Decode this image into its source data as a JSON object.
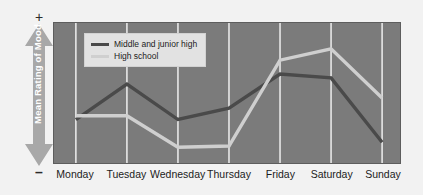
{
  "axis": {
    "y_title": "Mean Rating of Mood",
    "positive_marker": "+",
    "negative_marker": "–"
  },
  "legend": {
    "items": [
      {
        "label": "Middle and junior high",
        "color": "#4a4a4a"
      },
      {
        "label": "High school",
        "color": "#cfcfcf"
      }
    ]
  },
  "colors": {
    "plot_background": "#7b7b7b",
    "figure_background": "#f2f2f2",
    "gridline": "#e8e8e8",
    "middle_junior_high": "#4a4a4a",
    "high_school": "#cfcfcf",
    "axis_arrow": "#a8a8a8",
    "text": "#1c1c1c"
  },
  "xlabels": [
    "Monday",
    "Tuesday",
    "Wednesday",
    "Thursday",
    "Friday",
    "Saturday",
    "Sunday"
  ],
  "chart_data": {
    "type": "line",
    "title": "",
    "xlabel": "",
    "ylabel": "Mean Rating of Mood",
    "ylim": [
      0,
      100
    ],
    "ytick_labels": [
      "–",
      "+"
    ],
    "grid": true,
    "grid_axis": "x",
    "legend_position": "upper-left-inside",
    "categories": [
      "Monday",
      "Tuesday",
      "Wednesday",
      "Thursday",
      "Friday",
      "Saturday",
      "Sunday"
    ],
    "series": [
      {
        "name": "Middle and junior high",
        "color": "#4a4a4a",
        "values": [
          29,
          57,
          29,
          38,
          65,
          62,
          11
        ]
      },
      {
        "name": "High school",
        "color": "#cfcfcf",
        "values": [
          32,
          32,
          7,
          8,
          76,
          85,
          46
        ]
      }
    ]
  }
}
